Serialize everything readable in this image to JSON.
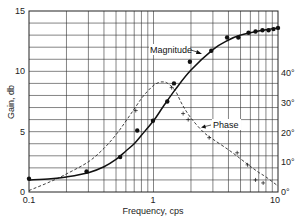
{
  "chart_data": {
    "type": "line",
    "title": "",
    "xlabel": "Frequency, cps",
    "ylabel": "Gain, db",
    "y2label": "Phase, degrees",
    "xscale": "log",
    "xlim": [
      0.1,
      10
    ],
    "ylim": [
      0,
      15
    ],
    "y2lim": [
      0,
      60
    ],
    "grid": true,
    "legend": "none (inline annotations)",
    "x_ticks": [
      "0.1",
      "1",
      "10"
    ],
    "y_ticks": [
      "0",
      "5",
      "10",
      "15"
    ],
    "y2_ticks": [
      "0°",
      "10°",
      "20°",
      "30°",
      "40°"
    ],
    "annotations": [
      {
        "text": "Magnitude",
        "points_to": "Magnitude curve"
      },
      {
        "text": "Phase",
        "points_to": "Phase curve"
      }
    ],
    "series": [
      {
        "name": "Magnitude",
        "axis": "left",
        "style": "solid line with filled dot markers",
        "curve": {
          "x": [
            0.1,
            0.15,
            0.2,
            0.3,
            0.4,
            0.5,
            0.6,
            0.7,
            0.8,
            1.0,
            1.2,
            1.5,
            2.0,
            3.0,
            4.0,
            5.0,
            6.0,
            7.0,
            8.0,
            10.0
          ],
          "y": [
            1.0,
            1.1,
            1.25,
            1.6,
            2.1,
            2.7,
            3.4,
            4.0,
            4.7,
            5.9,
            7.1,
            8.5,
            10.1,
            11.8,
            12.6,
            13.0,
            13.2,
            13.35,
            13.45,
            13.6
          ]
        },
        "points": {
          "x": [
            0.1,
            0.29,
            0.54,
            0.74,
            0.99,
            1.29,
            1.46,
            1.96,
            2.91,
            3.9,
            4.8,
            5.8,
            6.6,
            7.5,
            8.4,
            9.2,
            10.0
          ],
          "y": [
            1.1,
            1.7,
            2.9,
            5.1,
            5.9,
            7.5,
            9.0,
            10.8,
            11.7,
            12.8,
            12.8,
            13.2,
            13.3,
            13.4,
            13.4,
            13.5,
            13.6
          ]
        }
      },
      {
        "name": "Phase",
        "axis": "right",
        "style": "dashed line with cross markers",
        "curve": {
          "x": [
            0.1,
            0.15,
            0.2,
            0.3,
            0.4,
            0.5,
            0.6,
            0.7,
            0.8,
            0.9,
            1.0,
            1.1,
            1.2,
            1.3,
            1.5,
            1.7,
            2.0,
            2.5,
            3.0,
            4.0,
            5.0,
            6.0,
            7.0,
            8.0,
            10.0
          ],
          "y": [
            0.5,
            3.5,
            6.0,
            10.0,
            14.5,
            19.0,
            23.5,
            27.5,
            31.0,
            33.5,
            35.3,
            36.3,
            36.5,
            36.0,
            33.5,
            29.0,
            24.5,
            20.0,
            17.5,
            14.0,
            11.0,
            8.5,
            6.5,
            5.0,
            2.0
          ]
        },
        "points": {
          "x": [
            0.72,
            1.4,
            1.73,
            1.9,
            2.8,
            4.7,
            5.7,
            6.6,
            7.6
          ],
          "y": [
            27,
            34.6,
            26,
            24,
            18,
            13,
            9,
            4,
            3
          ]
        }
      }
    ]
  },
  "labels": {
    "xlabel": "Frequency, cps",
    "ylabel": "Gain, db",
    "magnitude": "Magnitude",
    "phase": "Phase",
    "x_ticks": [
      "0.1",
      "1",
      "10"
    ],
    "y_ticks": [
      "0",
      "5",
      "10",
      "15"
    ],
    "y2_ticks": [
      "0°",
      "10°",
      "20°",
      "30°",
      "40°"
    ]
  }
}
